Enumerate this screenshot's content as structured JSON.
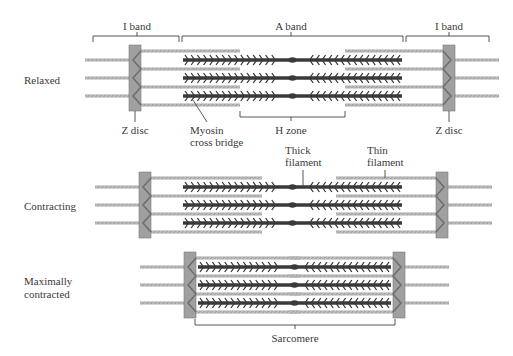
{
  "diagram": {
    "type": "sarcomere-contraction",
    "colors": {
      "thick_filament": "#3a3a3a",
      "thin_filament": "#a8a8a8",
      "z_disc": "#a0a0a0",
      "z_disc_border": "#7a7a7a",
      "label": "#3a3a3a",
      "bracket": "#444444"
    },
    "states": [
      {
        "id": "relaxed",
        "label": "Relaxed"
      },
      {
        "id": "contracting",
        "label": "Contracting"
      },
      {
        "id": "maximally-contracted",
        "label_line1": "Maximally",
        "label_line2": "contracted"
      }
    ],
    "top_labels": {
      "i_band_left": "I band",
      "a_band": "A band",
      "i_band_right": "I band"
    },
    "relaxed_callouts": {
      "z_disc_left": "Z disc",
      "myosin_line1": "Myosin",
      "myosin_line2": "cross bridge",
      "h_zone": "H zone",
      "z_disc_right": "Z disc"
    },
    "contracting_callouts": {
      "thick_line1": "Thick",
      "thick_line2": "filament",
      "thin_line1": "Thin",
      "thin_line2": "filament"
    },
    "bottom_label": "Sarcomere"
  }
}
